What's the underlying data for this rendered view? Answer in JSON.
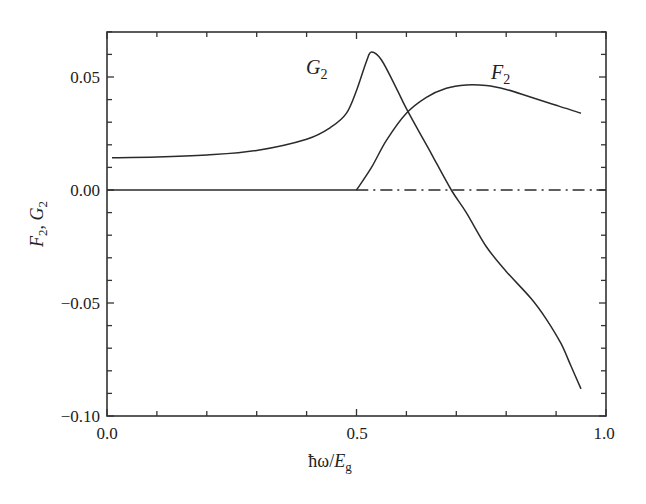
{
  "chart_data": {
    "type": "line",
    "title": "",
    "xlabel": "ħω/E_g",
    "ylabel": "F_2, G_2",
    "xlim": [
      0.0,
      1.0
    ],
    "ylim": [
      -0.1,
      0.07
    ],
    "x_ticks": [
      "0.0",
      "0.5",
      "1.0"
    ],
    "y_ticks": [
      "0.05",
      "0.00",
      "-0.05",
      "-0.10"
    ],
    "grid": false,
    "legend": "inline labels",
    "series": [
      {
        "name": "G_2",
        "style": "solid",
        "x": [
          0.01,
          0.1,
          0.2,
          0.3,
          0.4,
          0.45,
          0.48,
          0.5,
          0.52,
          0.53,
          0.55,
          0.58,
          0.6,
          0.65,
          0.69,
          0.72,
          0.76,
          0.8,
          0.85,
          0.88,
          0.91,
          0.93,
          0.95
        ],
        "values": [
          0.0143,
          0.0146,
          0.0155,
          0.0175,
          0.0225,
          0.028,
          0.034,
          0.044,
          0.057,
          0.061,
          0.0575,
          0.045,
          0.036,
          0.016,
          0.0,
          -0.01,
          -0.025,
          -0.036,
          -0.048,
          -0.057,
          -0.068,
          -0.078,
          -0.088
        ]
      },
      {
        "name": "F_2",
        "style": "solid",
        "x": [
          0.0,
          0.1,
          0.2,
          0.3,
          0.4,
          0.5,
          0.53,
          0.56,
          0.6,
          0.64,
          0.68,
          0.72,
          0.76,
          0.8,
          0.85,
          0.9,
          0.95
        ],
        "values": [
          0.0,
          0.0,
          0.0,
          0.0,
          0.0,
          0.0,
          0.01,
          0.022,
          0.034,
          0.041,
          0.045,
          0.0465,
          0.0462,
          0.0445,
          0.041,
          0.0375,
          0.034
        ]
      },
      {
        "name": "zero reference",
        "style": "dash-dot",
        "x": [
          0.5,
          1.0
        ],
        "values": [
          0.0,
          0.0
        ]
      }
    ],
    "annotations": [
      {
        "text": "G_2",
        "x": 0.47,
        "y": 0.054
      },
      {
        "text": "F_2",
        "x": 0.78,
        "y": 0.051
      }
    ]
  },
  "labels": {
    "x_ticks": [
      "0.0",
      "0.5",
      "1.0"
    ],
    "y_ticks": [
      "0.05",
      "0.00",
      "−0.05",
      "−0.10"
    ],
    "xlabel_main": "ħω/",
    "xlabel_var": "E",
    "xlabel_sub": "g",
    "ylabel_f": "F",
    "ylabel_sep": ", ",
    "ylabel_g": "G",
    "ylabel_sub": "2",
    "series_g": "G",
    "series_f": "F",
    "series_sub": "2"
  }
}
